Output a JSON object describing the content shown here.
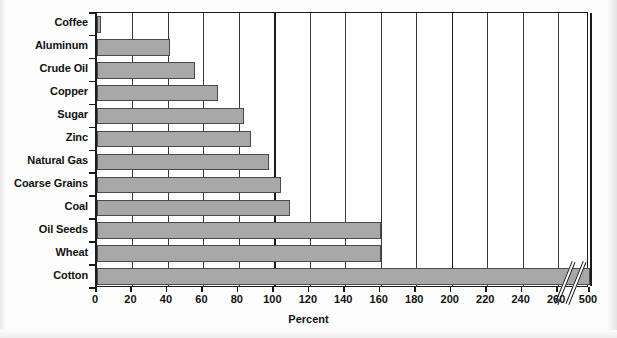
{
  "chart_data": {
    "type": "bar",
    "orientation": "horizontal",
    "title": "",
    "xlabel": "Percent",
    "ylabel": "",
    "categories": [
      "Coffee",
      "Aluminum",
      "Crude Oil",
      "Copper",
      "Sugar",
      "Zinc",
      "Natural Gas",
      "Coarse Grains",
      "Coal",
      "Oil Seeds",
      "Wheat",
      "Cotton"
    ],
    "values": [
      2,
      41,
      55,
      68,
      83,
      87,
      97,
      104,
      109,
      160,
      160,
      500
    ],
    "xticks": [
      0,
      20,
      40,
      60,
      80,
      100,
      120,
      140,
      160,
      180,
      200,
      220,
      240,
      260,
      500
    ],
    "xtick_labels": [
      "0",
      "20",
      "40",
      "60",
      "80",
      "100",
      "120",
      "140",
      "160",
      "180",
      "200",
      "220",
      "240",
      "260",
      "500"
    ],
    "xlim": [
      0,
      280
    ],
    "axis_break": {
      "present": true,
      "after_value": 265,
      "resumes_label": "500"
    },
    "grid": "vertical",
    "legend": "none",
    "bar_color": "#a8a8a8",
    "bar_edge_color": "#4a4a4a",
    "axis_color": "#1a1a1a",
    "background": "#ffffff"
  }
}
